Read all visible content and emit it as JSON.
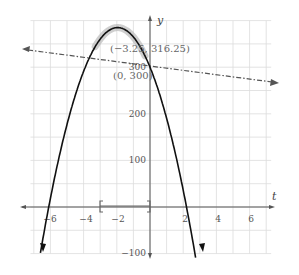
{
  "chart_data": {
    "type": "line",
    "title": "",
    "xlabel": "t",
    "ylabel": "y",
    "xlim": [
      -7.8,
      7.6
    ],
    "ylim": [
      -100,
      400
    ],
    "grid": true,
    "x_ticks": [
      -6,
      -4,
      -2,
      2,
      4,
      6
    ],
    "x_tick_labels": [
      "−6",
      "−4",
      "−2",
      "2",
      "4",
      "6"
    ],
    "y_ticks": [
      -100,
      100,
      200,
      300
    ],
    "y_tick_labels": [
      "−100",
      "100",
      "200",
      "300"
    ],
    "series": [
      {
        "name": "parabola",
        "style": "solid",
        "color": "#111111",
        "description": "downward parabola through (0,300), roots near t=-6.1 and t=2.2, vertex near t=-1.95",
        "roots": [
          -6.1,
          2.2
        ],
        "y_intercept": 300
      },
      {
        "name": "line",
        "style": "dash-dot",
        "color": "#555555",
        "slope": -4.6,
        "intercept": 300
      }
    ],
    "annotations": [
      {
        "text": "(−3.25, 316.25)",
        "near": "vertex"
      },
      {
        "text": "(0, 300)",
        "near": "y-intercept"
      }
    ],
    "interval_marker": {
      "from": -3,
      "to": 0,
      "label": "[ ]"
    }
  },
  "labels": {
    "x_axis": "t",
    "y_axis": "y",
    "vertex": "(−3.25, 316.25)",
    "intercept": "(0, 300)",
    "x_ticks": [
      "−6",
      "−4",
      "−2",
      "2",
      "4",
      "6"
    ],
    "y_ticks": [
      "300",
      "200",
      "100",
      "−100"
    ]
  }
}
